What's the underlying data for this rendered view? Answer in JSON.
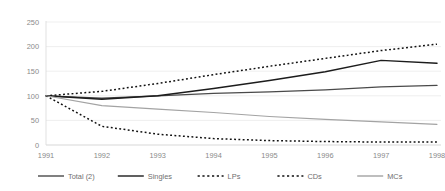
{
  "chart_data": {
    "type": "line",
    "title": "",
    "subtitle": "",
    "xlabel": "",
    "ylabel": "",
    "x": [
      1991,
      1992,
      1993,
      1994,
      1995,
      1996,
      1997,
      1998
    ],
    "xtick_labels": [
      "1991",
      "1992",
      "1993",
      "1994",
      "1995",
      "1996",
      "1997",
      "1998"
    ],
    "ytick_labels": [
      "0",
      "50",
      "100",
      "150",
      "200",
      "250"
    ],
    "yticks": [
      0,
      50,
      100,
      150,
      200,
      250
    ],
    "ylim": [
      0,
      250
    ],
    "grid": "horizontal",
    "legend_position": "bottom",
    "series": [
      {
        "name": "Total (2)",
        "label": "Total (2)",
        "style": "solid",
        "color": "#4a4a4a",
        "width": 1.3,
        "values": [
          100,
          95,
          100,
          105,
          108,
          112,
          118,
          121
        ]
      },
      {
        "name": "Singles",
        "label": "Singles",
        "style": "solid",
        "color": "#1c1c1c",
        "width": 1.5,
        "values": [
          100,
          93,
          100,
          115,
          131,
          149,
          172,
          166
        ]
      },
      {
        "name": "LPs",
        "label": "LPs",
        "style": "dotted",
        "color": "#111111",
        "width": 1.5,
        "values": [
          100,
          109,
          125,
          143,
          160,
          176,
          192,
          205
        ]
      },
      {
        "name": "CDs",
        "label": "CDs",
        "style": "dotted",
        "color": "#111111",
        "width": 1.5,
        "values": [
          100,
          38,
          22,
          13,
          9,
          7,
          6,
          6
        ]
      },
      {
        "name": "MCs",
        "label": "MCs",
        "style": "solid",
        "color": "#a3a3a3",
        "width": 1.1,
        "values": [
          100,
          80,
          73,
          66,
          58,
          52,
          47,
          42
        ]
      }
    ],
    "legend": [
      {
        "label": "Total (2)",
        "style": "solid",
        "color": "#4a4a4a"
      },
      {
        "label": "Singles",
        "style": "solid",
        "color": "#1c1c1c"
      },
      {
        "label": "LPs",
        "style": "dotted",
        "color": "#111111"
      },
      {
        "label": "CDs",
        "style": "dotted",
        "color": "#111111"
      },
      {
        "label": "MCs",
        "style": "solid",
        "color": "#a3a3a3"
      }
    ],
    "colors": {
      "grid": "#e8e8e8",
      "axis": "#d9d9d9",
      "tick_text": "#8a8a8a",
      "legend_text": "#6f6f6f",
      "background": "#ffffff"
    }
  }
}
